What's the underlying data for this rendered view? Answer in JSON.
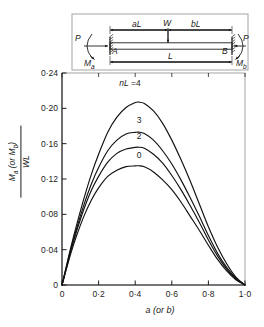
{
  "figure": {
    "axis_color": "#1d1d1d",
    "curve_color": "#111111"
  },
  "beam_diagram": {
    "name": "beam-free-body-diagram",
    "left_force": "P",
    "right_force": "P",
    "left_moment": "M",
    "left_moment_sub": "a",
    "right_moment": "M",
    "right_moment_sub": "b",
    "node_left": "A",
    "node_right": "B",
    "dim_left": "aL",
    "dim_right": "bL",
    "dim_total": "L",
    "load": "W"
  },
  "chart_data": {
    "type": "line",
    "title": "",
    "xlabel": "a  (or b)",
    "ylabel_numerator": "Mₐ (or Mᵇ)",
    "ylabel_denominator": "WL",
    "xlim": [
      0,
      1.0
    ],
    "ylim": [
      0,
      0.24
    ],
    "xticks": [
      0,
      0.2,
      0.4,
      0.6,
      0.8,
      1.0
    ],
    "xticklabels": [
      "0",
      "0·2",
      "0·4",
      "0·6",
      "0·8",
      "1·0"
    ],
    "yticks": [
      0,
      0.04,
      0.08,
      0.12,
      0.16,
      0.2,
      0.24
    ],
    "yticklabels": [
      "0",
      "0·04",
      "0·08",
      "0·12",
      "0·16",
      "0·20",
      "0·24"
    ],
    "grid": false,
    "legend_position": "inline-curve-labels",
    "legend_title": "nL =",
    "series": [
      {
        "name": "nL = 4",
        "label": "nL =4",
        "label_x": 0.4,
        "label_y": 0.228,
        "peak_x": 0.42,
        "peak_y": 0.207,
        "x": [
          0,
          0.02,
          0.05,
          0.08,
          0.12,
          0.16,
          0.2,
          0.25,
          0.3,
          0.35,
          0.4,
          0.42,
          0.45,
          0.5,
          0.55,
          0.6,
          0.65,
          0.7,
          0.75,
          0.8,
          0.85,
          0.9,
          0.95,
          1.0
        ],
        "y": [
          0,
          0.018,
          0.044,
          0.068,
          0.098,
          0.125,
          0.148,
          0.173,
          0.19,
          0.201,
          0.2065,
          0.207,
          0.2055,
          0.197,
          0.183,
          0.164,
          0.142,
          0.118,
          0.092,
          0.066,
          0.043,
          0.024,
          0.009,
          0
        ]
      },
      {
        "name": "nL = 3",
        "label": "3",
        "label_x": 0.425,
        "label_y": 0.186,
        "peak_x": 0.42,
        "peak_y": 0.173,
        "x": [
          0,
          0.02,
          0.05,
          0.08,
          0.12,
          0.16,
          0.2,
          0.25,
          0.3,
          0.35,
          0.4,
          0.42,
          0.45,
          0.5,
          0.55,
          0.6,
          0.65,
          0.7,
          0.75,
          0.8,
          0.85,
          0.9,
          0.95,
          1.0
        ],
        "y": [
          0,
          0.017,
          0.042,
          0.064,
          0.091,
          0.114,
          0.133,
          0.152,
          0.164,
          0.171,
          0.1728,
          0.173,
          0.1715,
          0.164,
          0.152,
          0.137,
          0.119,
          0.099,
          0.078,
          0.056,
          0.036,
          0.02,
          0.008,
          0
        ]
      },
      {
        "name": "nL = 2",
        "label": "2",
        "label_x": 0.425,
        "label_y": 0.168,
        "peak_x": 0.42,
        "peak_y": 0.156,
        "x": [
          0,
          0.02,
          0.05,
          0.08,
          0.12,
          0.16,
          0.2,
          0.25,
          0.3,
          0.35,
          0.4,
          0.42,
          0.45,
          0.5,
          0.55,
          0.6,
          0.65,
          0.7,
          0.75,
          0.8,
          0.85,
          0.9,
          0.95,
          1.0
        ],
        "y": [
          0,
          0.016,
          0.04,
          0.061,
          0.086,
          0.107,
          0.123,
          0.139,
          0.149,
          0.154,
          0.1558,
          0.156,
          0.1548,
          0.148,
          0.138,
          0.124,
          0.108,
          0.09,
          0.071,
          0.051,
          0.033,
          0.018,
          0.007,
          0
        ]
      },
      {
        "name": "nL = 0",
        "label": "0",
        "label_x": 0.425,
        "label_y": 0.146,
        "peak_x": 0.42,
        "peak_y": 0.135,
        "x": [
          0,
          0.02,
          0.05,
          0.08,
          0.12,
          0.16,
          0.2,
          0.25,
          0.3,
          0.35,
          0.4,
          0.42,
          0.45,
          0.5,
          0.55,
          0.6,
          0.65,
          0.7,
          0.75,
          0.8,
          0.85,
          0.9,
          0.95,
          1.0
        ],
        "y": [
          0,
          0.015,
          0.037,
          0.056,
          0.078,
          0.096,
          0.11,
          0.123,
          0.13,
          0.134,
          0.1348,
          0.135,
          0.1338,
          0.128,
          0.119,
          0.108,
          0.094,
          0.078,
          0.062,
          0.045,
          0.029,
          0.016,
          0.006,
          0
        ]
      }
    ]
  }
}
